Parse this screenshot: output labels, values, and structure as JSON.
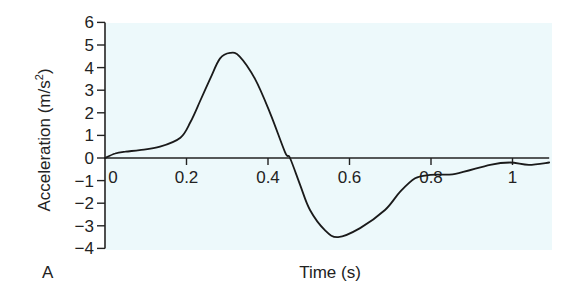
{
  "chart_data": {
    "type": "line",
    "title": "",
    "panel_label": "A",
    "xlabel": "Time (s)",
    "ylabel": "Acceleration (m/s",
    "ylabel_sup": "2",
    "ylabel_close": ")",
    "xlim": [
      0,
      1.09
    ],
    "ylim": [
      -4,
      6
    ],
    "xticks": [
      0,
      0.2,
      0.4,
      0.6,
      0.8,
      1
    ],
    "xtick_labels": [
      "0",
      "0.2",
      "0.4",
      "0.6",
      "0.8",
      "1"
    ],
    "yticks": [
      6,
      5,
      4,
      3,
      2,
      1,
      0,
      -1,
      -2,
      -3,
      -4
    ],
    "ytick_labels": [
      "6",
      "5",
      "4",
      "3",
      "2",
      "1",
      "0",
      "−1",
      "−2",
      "−3",
      "−4"
    ],
    "grid": false,
    "legend": null,
    "background_color": "#edf9fb",
    "line_color": "#1a1a1a",
    "series": [
      {
        "name": "Acceleration",
        "x": [
          0,
          0.025,
          0.05,
          0.085,
          0.135,
          0.185,
          0.21,
          0.233,
          0.258,
          0.282,
          0.307,
          0.33,
          0.368,
          0.405,
          0.442,
          0.454,
          0.479,
          0.503,
          0.54,
          0.572,
          0.626,
          0.687,
          0.724,
          0.761,
          0.798,
          0.86,
          0.945,
          0.994,
          1.04,
          1.09
        ],
        "y": [
          0,
          0.2,
          0.28,
          0.35,
          0.5,
          0.9,
          1.6,
          2.5,
          3.5,
          4.4,
          4.65,
          4.5,
          3.5,
          2.0,
          0.25,
          0,
          -1.2,
          -2.3,
          -3.2,
          -3.5,
          -3.1,
          -2.3,
          -1.5,
          -0.9,
          -0.75,
          -0.7,
          -0.3,
          -0.2,
          -0.3,
          -0.2
        ]
      }
    ]
  }
}
